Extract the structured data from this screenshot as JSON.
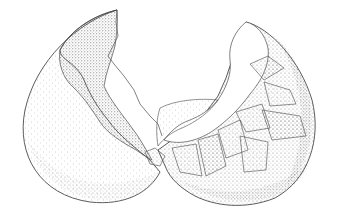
{
  "image": {
    "subject": "Stippled illustration of a cracked eggshell split into two halves",
    "width": 337,
    "height": 218,
    "colors": {
      "background": "#ffffff",
      "ink": "#4a4a4a",
      "stipple_dark": "#6e6e6e",
      "stipple_light": "#b5b5b5"
    },
    "elements": [
      {
        "name": "left-shell-half",
        "description": "Left eggshell half viewed from outside, dense stippling on inner edge"
      },
      {
        "name": "right-shell-half",
        "description": "Right eggshell half with jagged broken fragments inside"
      }
    ]
  }
}
